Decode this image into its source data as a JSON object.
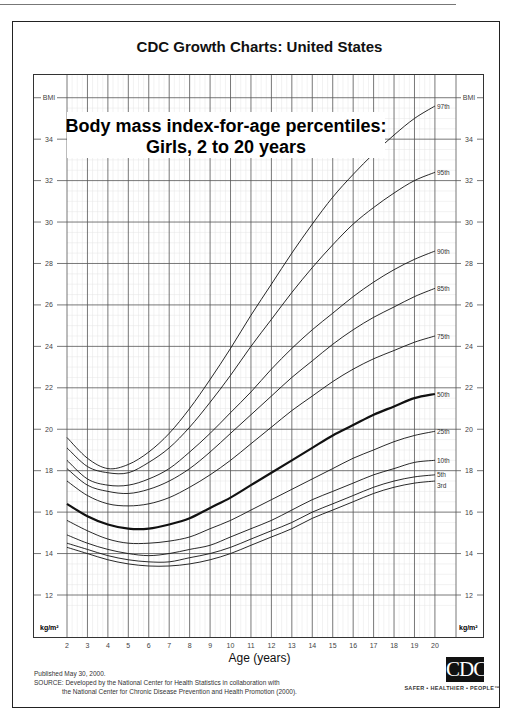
{
  "header": {
    "title": "CDC Growth Charts: United States"
  },
  "chart_title": {
    "line1": "Body mass index-for-age percentiles:",
    "line2": "Girls, 2 to 20 years"
  },
  "axes": {
    "y_label_top": "BMI",
    "y_unit": "kg/m²",
    "x_label": "Age (years)"
  },
  "footer": {
    "published": "Published May 30, 2000.",
    "source_line1": "SOURCE: Developed by the National Center for Health Statistics in collaboration with",
    "source_line2": "the National Center for Chronic Disease Prevention and Health Promotion (2000).",
    "logo_text": "CDC",
    "tagline": "SAFER • HEALTHIER • PEOPLE™"
  },
  "chart_data": {
    "type": "line",
    "title": "Body mass index-for-age percentiles: Girls, 2 to 20 years",
    "xlabel": "Age (years)",
    "ylabel": "BMI (kg/m²)",
    "xlim": [
      2,
      20
    ],
    "ylim": [
      12,
      35
    ],
    "x_ticks": [
      2,
      3,
      4,
      5,
      6,
      7,
      8,
      9,
      10,
      11,
      12,
      13,
      14,
      15,
      16,
      17,
      18,
      19,
      20
    ],
    "y_ticks": [
      12,
      14,
      16,
      18,
      20,
      22,
      24,
      26,
      28,
      30,
      32,
      34
    ],
    "grid": true,
    "x": [
      2,
      3,
      4,
      5,
      6,
      7,
      8,
      9,
      10,
      11,
      12,
      13,
      14,
      15,
      16,
      17,
      18,
      19,
      20
    ],
    "series": [
      {
        "name": "97th",
        "values": [
          19.6,
          18.6,
          18.1,
          18.3,
          18.9,
          19.8,
          21.0,
          22.4,
          23.9,
          25.5,
          27.0,
          28.5,
          29.9,
          31.2,
          32.3,
          33.3,
          34.2,
          35.0,
          35.6
        ]
      },
      {
        "name": "95th",
        "values": [
          19.1,
          18.2,
          17.9,
          17.9,
          18.4,
          19.1,
          20.1,
          21.3,
          22.6,
          24.0,
          25.3,
          26.6,
          27.8,
          28.9,
          29.9,
          30.7,
          31.4,
          32.0,
          32.4
        ]
      },
      {
        "name": "90th",
        "values": [
          18.5,
          17.6,
          17.3,
          17.3,
          17.6,
          18.1,
          18.9,
          19.8,
          20.8,
          21.8,
          22.9,
          23.9,
          24.8,
          25.6,
          26.4,
          27.1,
          27.7,
          28.2,
          28.6
        ]
      },
      {
        "name": "85th",
        "values": [
          18.1,
          17.3,
          17.0,
          16.9,
          17.1,
          17.5,
          18.1,
          18.9,
          19.8,
          20.7,
          21.6,
          22.5,
          23.3,
          24.1,
          24.8,
          25.4,
          25.9,
          26.4,
          26.8
        ]
      },
      {
        "name": "75th",
        "values": [
          17.5,
          16.8,
          16.4,
          16.3,
          16.4,
          16.7,
          17.2,
          17.8,
          18.5,
          19.3,
          20.1,
          20.9,
          21.6,
          22.3,
          22.9,
          23.4,
          23.8,
          24.2,
          24.5
        ]
      },
      {
        "name": "50th",
        "values": [
          16.4,
          15.8,
          15.4,
          15.2,
          15.2,
          15.4,
          15.7,
          16.2,
          16.7,
          17.3,
          17.9,
          18.5,
          19.1,
          19.7,
          20.2,
          20.7,
          21.1,
          21.5,
          21.7
        ]
      },
      {
        "name": "25th",
        "values": [
          15.6,
          15.1,
          14.7,
          14.5,
          14.5,
          14.6,
          14.8,
          15.2,
          15.6,
          16.1,
          16.6,
          17.1,
          17.6,
          18.1,
          18.6,
          19.0,
          19.4,
          19.7,
          19.9
        ]
      },
      {
        "name": "10th",
        "values": [
          14.9,
          14.5,
          14.2,
          14.0,
          13.9,
          14.0,
          14.2,
          14.4,
          14.8,
          15.2,
          15.6,
          16.1,
          16.6,
          17.0,
          17.4,
          17.8,
          18.1,
          18.4,
          18.5
        ]
      },
      {
        "name": "5th",
        "values": [
          14.5,
          14.2,
          13.9,
          13.7,
          13.6,
          13.6,
          13.8,
          14.0,
          14.3,
          14.7,
          15.1,
          15.5,
          16.0,
          16.4,
          16.8,
          17.2,
          17.5,
          17.7,
          17.8
        ]
      },
      {
        "name": "3rd",
        "values": [
          14.3,
          14.0,
          13.7,
          13.5,
          13.4,
          13.4,
          13.5,
          13.7,
          14.0,
          14.4,
          14.8,
          15.2,
          15.7,
          16.1,
          16.5,
          16.9,
          17.2,
          17.4,
          17.5
        ]
      }
    ],
    "emphasized_series": "50th"
  }
}
